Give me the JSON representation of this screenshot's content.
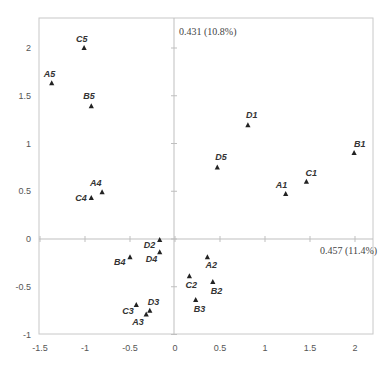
{
  "chart_data": {
    "type": "scatter",
    "title": "",
    "xlabel": "",
    "ylabel": "",
    "xlim": [
      -1.5,
      2.2
    ],
    "ylim": [
      -1,
      2.25
    ],
    "x_ticks": [
      "-1.5",
      "-1",
      "-0.5",
      "0",
      "0.5",
      "1",
      "1.5",
      "2"
    ],
    "y_ticks": [
      "-1",
      "-0.5",
      "0",
      "0.5",
      "1",
      "1.5",
      "2"
    ],
    "grid": false,
    "legend": null,
    "marker": "triangle",
    "annotations": {
      "vertical_axis_note": "0.431 (10.8%)",
      "horizontal_axis_note": "0.457 (11.4%)"
    },
    "points": [
      {
        "label": "C5",
        "x": -1.01,
        "y": 2.0,
        "lx": -8,
        "ly": -6
      },
      {
        "label": "A5",
        "x": -1.37,
        "y": 1.63,
        "lx": -8,
        "ly": -6
      },
      {
        "label": "B5",
        "x": -0.93,
        "y": 1.39,
        "lx": -8,
        "ly": -7
      },
      {
        "label": "A4",
        "x": -0.81,
        "y": 0.49,
        "lx": -12,
        "ly": -6
      },
      {
        "label": "C4",
        "x": -0.93,
        "y": 0.43,
        "lx": -16,
        "ly": 3
      },
      {
        "label": "D2",
        "x": -0.17,
        "y": -0.01,
        "lx": -16,
        "ly": 8
      },
      {
        "label": "D4",
        "x": -0.17,
        "y": -0.14,
        "lx": -14,
        "ly": 10
      },
      {
        "label": "B4",
        "x": -0.5,
        "y": -0.19,
        "lx": -16,
        "ly": 8
      },
      {
        "label": "C3",
        "x": -0.43,
        "y": -0.69,
        "lx": -14,
        "ly": 9
      },
      {
        "label": "D3",
        "x": -0.28,
        "y": -0.75,
        "lx": -2,
        "ly": -6
      },
      {
        "label": "A3",
        "x": -0.32,
        "y": -0.79,
        "lx": -14,
        "ly": 11
      },
      {
        "label": "A2",
        "x": 0.36,
        "y": -0.19,
        "lx": -2,
        "ly": 11
      },
      {
        "label": "C2",
        "x": 0.16,
        "y": -0.39,
        "lx": -4,
        "ly": 12
      },
      {
        "label": "B2",
        "x": 0.42,
        "y": -0.45,
        "lx": -2,
        "ly": 12
      },
      {
        "label": "B3",
        "x": 0.23,
        "y": -0.64,
        "lx": -2,
        "ly": 12
      },
      {
        "label": "D1",
        "x": 0.81,
        "y": 1.19,
        "lx": -2,
        "ly": -7
      },
      {
        "label": "D5",
        "x": 0.47,
        "y": 0.75,
        "lx": -2,
        "ly": -7
      },
      {
        "label": "B1",
        "x": 1.99,
        "y": 0.9,
        "lx": 0,
        "ly": -6
      },
      {
        "label": "C1",
        "x": 1.46,
        "y": 0.6,
        "lx": -1,
        "ly": -6
      },
      {
        "label": "A1",
        "x": 1.23,
        "y": 0.47,
        "lx": -10,
        "ly": -6
      }
    ]
  }
}
